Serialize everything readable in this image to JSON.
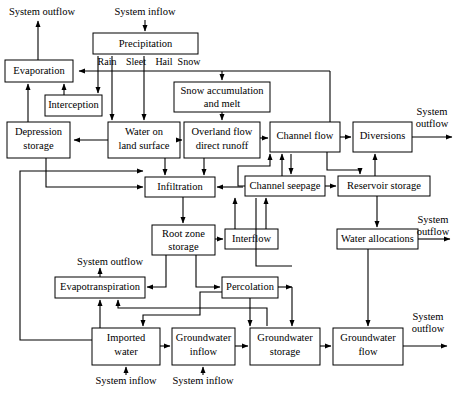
{
  "diagram": {
    "boxes": [
      {
        "id": "precipitation",
        "label_line1": "Precipitation",
        "label_line2": ""
      },
      {
        "id": "evaporation",
        "label_line1": "Evaporation",
        "label_line2": ""
      },
      {
        "id": "interception",
        "label_line1": "Interception",
        "label_line2": ""
      },
      {
        "id": "depression-storage",
        "label_line1": "Depression",
        "label_line2": "storage"
      },
      {
        "id": "water-on-land-surface",
        "label_line1": "Water on",
        "label_line2": "land surface"
      },
      {
        "id": "snow-accumulation",
        "label_line1": "Snow accumulation",
        "label_line2": "and melt"
      },
      {
        "id": "overland-flow",
        "label_line1": "Overland flow",
        "label_line2": "direct runoff"
      },
      {
        "id": "channel-flow",
        "label_line1": "Channel flow",
        "label_line2": ""
      },
      {
        "id": "diversions",
        "label_line1": "Diversions",
        "label_line2": ""
      },
      {
        "id": "infiltration",
        "label_line1": "Infiltration",
        "label_line2": ""
      },
      {
        "id": "channel-seepage",
        "label_line1": "Channel seepage",
        "label_line2": ""
      },
      {
        "id": "reservoir-storage",
        "label_line1": "Reservoir storage",
        "label_line2": ""
      },
      {
        "id": "root-zone-storage",
        "label_line1": "Root zone",
        "label_line2": "storage"
      },
      {
        "id": "interflow",
        "label_line1": "Interflow",
        "label_line2": ""
      },
      {
        "id": "water-allocations",
        "label_line1": "Water allocations",
        "label_line2": ""
      },
      {
        "id": "evapotranspiration",
        "label_line1": "Evapotranspiration",
        "label_line2": ""
      },
      {
        "id": "percolation",
        "label_line1": "Percolation",
        "label_line2": ""
      },
      {
        "id": "imported-water",
        "label_line1": "Imported",
        "label_line2": "water"
      },
      {
        "id": "groundwater-inflow",
        "label_line1": "Groundwater",
        "label_line2": "inflow"
      },
      {
        "id": "groundwater-storage",
        "label_line1": "Groundwater",
        "label_line2": "storage"
      },
      {
        "id": "groundwater-flow",
        "label_line1": "Groundwater",
        "label_line2": "flow"
      }
    ],
    "precipitation_types": [
      "Rain",
      "Sleet",
      "Hail",
      "Snow"
    ],
    "external_labels": {
      "inflow_top": "System inflow",
      "outflow_top_left": "System outflow",
      "outflow_diversions_l1": "System",
      "outflow_diversions_l2": "outflow",
      "outflow_allocations_l1": "System",
      "outflow_allocations_l2": "outflow",
      "outflow_evapotranspiration": "System outflow",
      "outflow_groundwater_l1": "System",
      "outflow_groundwater_l2": "outflow",
      "inflow_imported": "System inflow",
      "inflow_groundwater": "System inflow"
    },
    "colors": {
      "box_fill": "#ffffff",
      "stroke": "#000000",
      "background": "#ffffff"
    }
  }
}
